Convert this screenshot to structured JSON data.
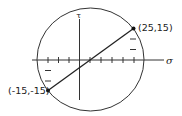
{
  "diagram": {
    "type": "mohr-circle",
    "axes": {
      "x_label": "σ",
      "y_label": "τ",
      "x_ticks": [
        -15,
        -10,
        -5,
        5,
        10,
        15,
        20,
        25
      ],
      "y_ticks_right": [
        5,
        10
      ],
      "y_ticks_left": [
        -5,
        -10
      ]
    },
    "points": [
      {
        "label": "(25,15)",
        "sigma": 25,
        "tau": 15
      },
      {
        "label": "(-15,-15)",
        "sigma": -15,
        "tau": -15
      }
    ],
    "circle": {
      "center_sigma": 5,
      "center_tau": 0,
      "radius": 25
    },
    "colors": {
      "stroke": "#222222",
      "background": "#ffffff"
    }
  }
}
